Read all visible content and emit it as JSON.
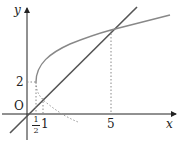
{
  "diagram": {
    "axes": {
      "x_label": "x",
      "y_label": "y",
      "origin_label": "O"
    },
    "ticks": {
      "x_half": {
        "numerator": "1",
        "denominator": "2"
      },
      "x_one": "1",
      "x_five": "5",
      "y_two": "2"
    },
    "colors": {
      "line": "#555555",
      "curve": "#777777",
      "axis": "#222222",
      "dotted": "#888888"
    }
  }
}
